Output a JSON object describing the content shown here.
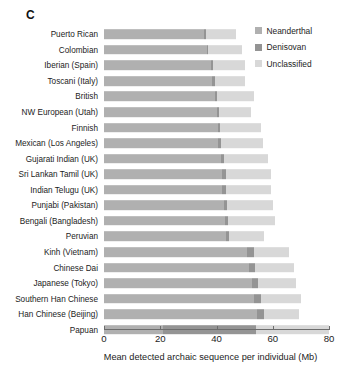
{
  "panel": {
    "letter": "C"
  },
  "legend": {
    "position": "top-right",
    "items": [
      {
        "label": "Neanderthal",
        "color": "#b0b0b0"
      },
      {
        "label": "Denisovan",
        "color": "#949494"
      },
      {
        "label": "Unclassified",
        "color": "#d8d8d8"
      }
    ]
  },
  "axis": {
    "title": "Mean detected archaic sequence per individual (Mb)",
    "ticks": [
      "0",
      "20",
      "40",
      "60",
      "80"
    ],
    "min": 0,
    "max": 80
  },
  "chart_data": {
    "type": "bar",
    "orientation": "horizontal",
    "stacked": true,
    "title": "",
    "xlabel": "Mean detected archaic sequence per individual (Mb)",
    "ylabel": "",
    "xlim": [
      0,
      80
    ],
    "xticks": [
      0,
      20,
      40,
      60,
      80
    ],
    "grid": false,
    "legend_position": "top-right",
    "categories": [
      "Puerto Rican",
      "Colombian",
      "Iberian (Spain)",
      "Toscani (Italy)",
      "British",
      "NW European (Utah)",
      "Finnish",
      "Mexican (Los Angeles)",
      "Gujarati Indian (UK)",
      "Sri Lankan Tamil (UK)",
      "Indian Telugu (UK)",
      "Punjabi (Pakistan)",
      "Bengali (Bangladesh)",
      "Peruvian",
      "Kinh (Vietnam)",
      "Chinese Dai",
      "Japanese (Tokyo)",
      "Southern Han Chinese",
      "Han Chinese (Beijing)",
      "Papuan"
    ],
    "series": [
      {
        "name": "Neanderthal",
        "color": "#b0b0b0",
        "values": [
          35.5,
          36.5,
          38.0,
          38.5,
          39.5,
          40.0,
          40.5,
          40.5,
          41.5,
          42.0,
          42.0,
          42.5,
          43.0,
          43.5,
          51.0,
          51.5,
          52.5,
          53.5,
          54.5,
          21.0
        ]
      },
      {
        "name": "Denisovan",
        "color": "#949494",
        "values": [
          0.6,
          0.6,
          0.8,
          0.8,
          0.8,
          0.8,
          0.8,
          1.0,
          1.2,
          1.2,
          1.2,
          1.2,
          1.2,
          1.0,
          2.2,
          2.2,
          2.4,
          2.4,
          2.4,
          33.0
        ]
      },
      {
        "name": "Unclassified",
        "color": "#d8d8d8",
        "values": [
          11.0,
          12.0,
          11.5,
          11.0,
          13.0,
          11.5,
          14.5,
          15.0,
          15.5,
          16.0,
          16.0,
          16.5,
          16.5,
          12.5,
          12.5,
          14.0,
          13.5,
          14.0,
          12.5,
          26.0
        ]
      }
    ],
    "totals": [
      47.1,
      49.1,
      50.3,
      50.3,
      53.3,
      52.3,
      55.8,
      56.5,
      58.2,
      59.2,
      59.2,
      60.2,
      60.7,
      57.0,
      65.7,
      67.7,
      68.4,
      69.9,
      69.4,
      80.0
    ]
  }
}
